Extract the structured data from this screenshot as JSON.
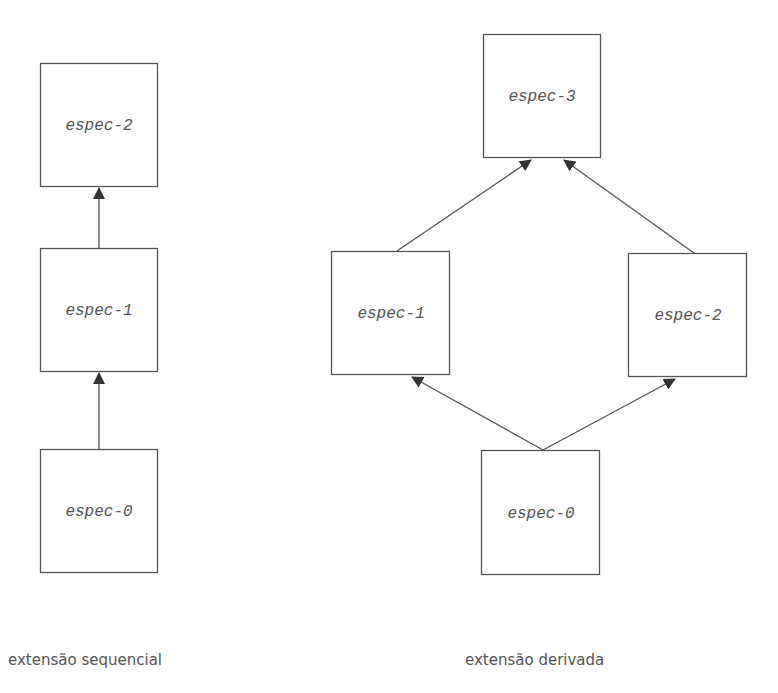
{
  "diagrams": {
    "sequential": {
      "caption": "extensão sequencial",
      "boxes": [
        {
          "id": "espec-2",
          "label": "espec-2"
        },
        {
          "id": "espec-1",
          "label": "espec-1"
        },
        {
          "id": "espec-0",
          "label": "espec-0"
        }
      ],
      "edges": [
        {
          "from": "espec-0",
          "to": "espec-1"
        },
        {
          "from": "espec-1",
          "to": "espec-2"
        }
      ]
    },
    "derived": {
      "caption": "extensão derivada",
      "boxes": [
        {
          "id": "espec-3",
          "label": "espec-3"
        },
        {
          "id": "espec-1",
          "label": "espec-1"
        },
        {
          "id": "espec-2",
          "label": "espec-2"
        },
        {
          "id": "espec-0",
          "label": "espec-0"
        }
      ],
      "edges": [
        {
          "from": "espec-1",
          "to": "espec-3"
        },
        {
          "from": "espec-2",
          "to": "espec-3"
        },
        {
          "from": "espec-0",
          "to": "espec-1"
        },
        {
          "from": "espec-0",
          "to": "espec-2"
        }
      ]
    }
  },
  "colors": {
    "stroke": "#555555",
    "text": "#555555"
  }
}
